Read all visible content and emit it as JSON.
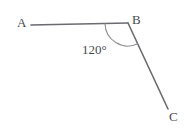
{
  "figure": {
    "type": "geometry-angle-diagram",
    "background_color": "#ffffff",
    "stroke_color": "#6b6b70",
    "text_color": "#4a4a4f",
    "stroke_width": 1.6,
    "points": {
      "A": {
        "label": "A",
        "x": 31,
        "y": 25
      },
      "B": {
        "label": "B",
        "x": 128,
        "y": 23
      },
      "C": {
        "label": "C",
        "x": 168,
        "y": 109
      }
    },
    "segments": [
      {
        "name": "segment-ab",
        "from": "A",
        "to": "B"
      },
      {
        "name": "segment-bc",
        "from": "B",
        "to": "C"
      }
    ],
    "angle": {
      "vertex": "B",
      "measure": "120°",
      "value": 120,
      "unit": "degrees",
      "arc_radius": 23,
      "arc_path": "M 105.1 23.4 A 23 23 0 0 0 137.1 44.2"
    },
    "labels": {
      "a": "A",
      "b": "B",
      "c": "C",
      "angle": "120°"
    }
  }
}
